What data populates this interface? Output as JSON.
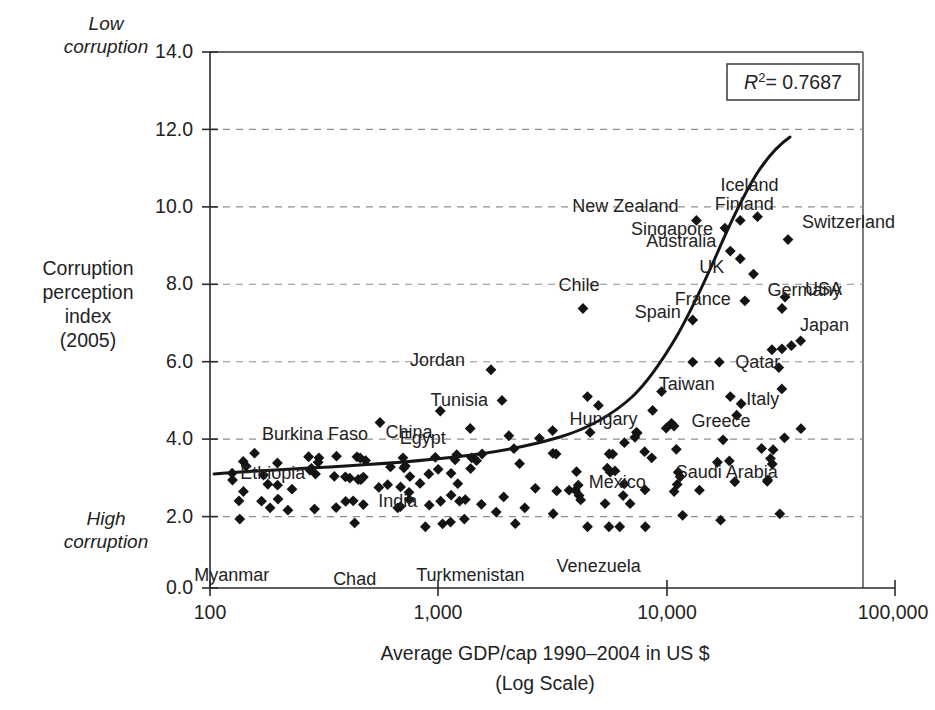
{
  "chart_data": {
    "type": "scatter",
    "title": "",
    "xlabel": "Average GDP/cap 1990–2004 in US $",
    "xlabel_line2": "(Log Scale)",
    "ylabel_lines": [
      "Corruption",
      "perception",
      "index",
      "(2005)"
    ],
    "xscale": "log",
    "xlim": [
      100,
      100000
    ],
    "ylim": [
      0.0,
      14.0
    ],
    "grid": "horizontal-dashed",
    "legend": "none",
    "annotations": {
      "r2_symbol": "R",
      "r2_exponent": "2",
      "r2_value": "= 0.7687",
      "r2_full": "R2 = 0.7687",
      "axis_note_top": [
        "Low",
        "corruption"
      ],
      "axis_note_bottom": [
        "High",
        "corruption"
      ]
    },
    "xticks": [
      {
        "value": 100,
        "label": "100"
      },
      {
        "value": 1000,
        "label": "1,000"
      },
      {
        "value": 10000,
        "label": "10,000"
      },
      {
        "value": 100000,
        "label": "100,000"
      }
    ],
    "yticks": [
      {
        "value": 0.0,
        "label": "0.0"
      },
      {
        "value": 2.0,
        "label": "2.0"
      },
      {
        "value": 4.0,
        "label": "4.0"
      },
      {
        "value": 6.0,
        "label": "6.0"
      },
      {
        "value": 8.0,
        "label": "8.0"
      },
      {
        "value": 10.0,
        "label": "10.0"
      },
      {
        "value": 12.0,
        "label": "12.0"
      },
      {
        "value": 14.0,
        "label": "14.0"
      }
    ],
    "labeled_countries": [
      {
        "name": "Myanmar",
        "gdp": 135,
        "cpi": 1.8
      },
      {
        "name": "Ethiopia",
        "gdp": 125,
        "cpi": 3.0
      },
      {
        "name": "Chad",
        "gdp": 430,
        "cpi": 1.7
      },
      {
        "name": "Burkina Faso",
        "gdp": 300,
        "cpi": 3.4
      },
      {
        "name": "India",
        "gdp": 600,
        "cpi": 2.7
      },
      {
        "name": "China",
        "gdp": 700,
        "cpi": 3.4
      },
      {
        "name": "Turkmenistan",
        "gdp": 1300,
        "cpi": 1.8
      },
      {
        "name": "Egypt",
        "gdp": 1400,
        "cpi": 3.4
      },
      {
        "name": "Tunisia",
        "gdp": 1900,
        "cpi": 4.9
      },
      {
        "name": "Jordan",
        "gdp": 1700,
        "cpi": 5.7
      },
      {
        "name": "Chile",
        "gdp": 4300,
        "cpi": 7.3
      },
      {
        "name": "Hungary",
        "gdp": 4500,
        "cpi": 5.0
      },
      {
        "name": "Venezuela",
        "gdp": 4200,
        "cpi": 2.3
      },
      {
        "name": "Mexico",
        "gdp": 5600,
        "cpi": 3.5
      },
      {
        "name": "Saudi Arabia",
        "gdp": 8600,
        "cpi": 3.4
      },
      {
        "name": "Greece",
        "gdp": 10500,
        "cpi": 4.3
      },
      {
        "name": "Spain",
        "gdp": 13000,
        "cpi": 7.0
      },
      {
        "name": "Taiwan",
        "gdp": 13000,
        "cpi": 5.9
      },
      {
        "name": "Italy",
        "gdp": 19000,
        "cpi": 5.0
      },
      {
        "name": "Qatar",
        "gdp": 17000,
        "cpi": 5.9
      },
      {
        "name": "New Zealand",
        "gdp": 13500,
        "cpi": 9.6
      },
      {
        "name": "Singapore",
        "gdp": 18000,
        "cpi": 9.4
      },
      {
        "name": "Australia",
        "gdp": 19000,
        "cpi": 8.8
      },
      {
        "name": "UK",
        "gdp": 21000,
        "cpi": 8.6
      },
      {
        "name": "France",
        "gdp": 22000,
        "cpi": 7.5
      },
      {
        "name": "Finland",
        "gdp": 21000,
        "cpi": 9.6
      },
      {
        "name": "Iceland",
        "gdp": 25000,
        "cpi": 9.7
      },
      {
        "name": "Germany",
        "gdp": 24000,
        "cpi": 8.2
      },
      {
        "name": "Japan",
        "gdp": 32000,
        "cpi": 7.3
      },
      {
        "name": "USA",
        "gdp": 33000,
        "cpi": 7.6
      },
      {
        "name": "Switzerland",
        "gdp": 34000,
        "cpi": 9.1
      }
    ]
  }
}
